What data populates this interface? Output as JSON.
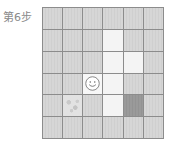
{
  "header": {
    "step_label": "第6步"
  },
  "board": {
    "rows": 6,
    "cols": 6,
    "cells": [
      [
        "wall",
        "wall",
        "wall",
        "wall",
        "wall",
        "wall"
      ],
      [
        "wall",
        "wall",
        "wall",
        "floor",
        "wall",
        "wall"
      ],
      [
        "wall",
        "wall",
        "wall",
        "floor",
        "floor",
        "wall"
      ],
      [
        "wall",
        "wall",
        "player",
        "floor",
        "wall",
        "wall"
      ],
      [
        "wall",
        "pattern",
        "wall",
        "floor",
        "dark",
        "wall"
      ],
      [
        "wall",
        "wall",
        "wall",
        "wall",
        "wall",
        "wall"
      ]
    ],
    "player": {
      "row": 3,
      "col": 2,
      "icon": "smiley-face-icon"
    },
    "colors": {
      "wall": "#d6d6d6",
      "floor": "#f4f4f4",
      "dark": "#9a9a9a",
      "border": "#8c8c8c"
    }
  }
}
